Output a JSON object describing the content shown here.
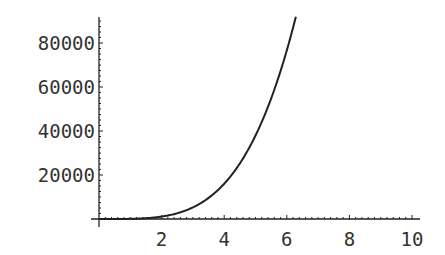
{
  "chart_data": {
    "type": "line",
    "title": "",
    "xlabel": "",
    "ylabel": "",
    "xlim": [
      0,
      10
    ],
    "ylim": [
      0,
      92000
    ],
    "grid": false,
    "legend": null,
    "x_ticks": [
      "2",
      "4",
      "6",
      "8",
      "10"
    ],
    "y_ticks": [
      "20000",
      "40000",
      "60000",
      "80000"
    ],
    "series": [
      {
        "name": "curve",
        "x": [
          0,
          0.5,
          1,
          1.5,
          2,
          2.5,
          3,
          3.5,
          4,
          4.5,
          5,
          5.5,
          6,
          6.29
        ],
        "y": [
          0,
          5,
          76,
          363,
          1100,
          2610,
          5300,
          9640,
          16000,
          25000,
          38000,
          54700,
          76400,
          92000
        ]
      }
    ]
  }
}
